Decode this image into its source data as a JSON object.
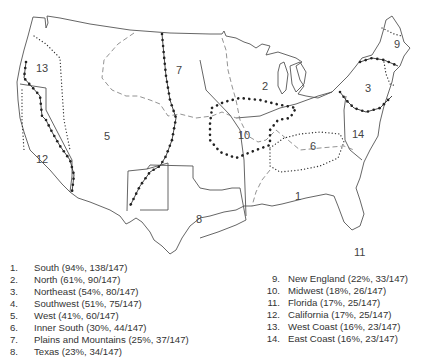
{
  "regions": [
    {
      "id": "1",
      "name": "South",
      "percent": "94%",
      "count": "138/147",
      "label": "South (94%, 138/147)"
    },
    {
      "id": "2",
      "name": "North",
      "percent": "61%",
      "count": "90/147",
      "label": "North (61%, 90/147)"
    },
    {
      "id": "3",
      "name": "Northeast",
      "percent": "54%",
      "count": "80/147",
      "label": "Northeast (54%, 80/147)"
    },
    {
      "id": "4",
      "name": "Southwest",
      "percent": "51%",
      "count": "75/147",
      "label": "Southwest (51%, 75/147)"
    },
    {
      "id": "5",
      "name": "West",
      "percent": "41%",
      "count": "60/147",
      "label": "West (41%, 60/147)"
    },
    {
      "id": "6",
      "name": "Inner South",
      "percent": "30%",
      "count": "44/147",
      "label": "Inner South (30%, 44/147)"
    },
    {
      "id": "7",
      "name": "Plains and Mountains",
      "percent": "25%",
      "count": "37/147",
      "label": "Plains and Mountains (25%, 37/147)"
    },
    {
      "id": "8",
      "name": "Texas",
      "percent": "23%",
      "count": "34/147",
      "label": "Texas (23%, 34/147)"
    },
    {
      "id": "9",
      "name": "New England",
      "percent": "22%",
      "count": "33/147",
      "label": "New England (22%, 33/147)"
    },
    {
      "id": "10",
      "name": "Midwest",
      "percent": "18%",
      "count": "26/147",
      "label": "Midwest (18%, 26/147)"
    },
    {
      "id": "11",
      "name": "Florida",
      "percent": "17%",
      "count": "25/147",
      "label": "Florida (17%, 25/147)"
    },
    {
      "id": "12",
      "name": "California",
      "percent": "17%",
      "count": "25/147",
      "label": "California (17%, 25/147)"
    },
    {
      "id": "13",
      "name": "West Coast",
      "percent": "16%",
      "count": "23/147",
      "label": "West Coast (16%, 23/147)"
    },
    {
      "id": "14",
      "name": "East Coast",
      "percent": "16%",
      "count": "23/147",
      "label": "East Coast (16%, 23/147)"
    }
  ],
  "map_labels": [
    "1",
    "2",
    "3",
    "5",
    "6",
    "7",
    "8",
    "9",
    "10",
    "11",
    "12",
    "13",
    "14"
  ],
  "legend_suffix": "."
}
